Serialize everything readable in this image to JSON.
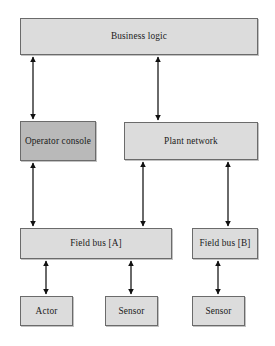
{
  "diagram": {
    "background_color": "#ffffff",
    "box_fill_light": "#dcdcdc",
    "box_fill_dark": "#b9b9b9",
    "box_border_color": "#6b6b6b",
    "arrow_color": "#101010",
    "nodes": [
      {
        "id": "business-logic",
        "label": "Business logic",
        "shade": "light",
        "x": 20,
        "y": 18,
        "w": 238,
        "h": 37
      },
      {
        "id": "operator-console",
        "label": "Operator console",
        "shade": "dark",
        "x": 20,
        "y": 121,
        "w": 76,
        "h": 40
      },
      {
        "id": "plant-network",
        "label": "Plant network",
        "shade": "light",
        "x": 124,
        "y": 122,
        "w": 134,
        "h": 38
      },
      {
        "id": "field-bus-a",
        "label": "Field bus [A]",
        "shade": "light",
        "x": 20,
        "y": 228,
        "w": 152,
        "h": 31
      },
      {
        "id": "field-bus-b",
        "label": "Field bus [B]",
        "shade": "light",
        "x": 192,
        "y": 228,
        "w": 66,
        "h": 31
      },
      {
        "id": "actor",
        "label": "Actor",
        "shade": "light",
        "x": 20,
        "y": 296,
        "w": 53,
        "h": 30
      },
      {
        "id": "sensor-a",
        "label": "Sensor",
        "shade": "light",
        "x": 105,
        "y": 296,
        "w": 53,
        "h": 30
      },
      {
        "id": "sensor-b",
        "label": "Sensor",
        "shade": "light",
        "x": 192,
        "y": 296,
        "w": 53,
        "h": 30
      }
    ],
    "connections": [
      {
        "id": "business-logic-to-operator-console",
        "from": "business-logic",
        "to": "operator-console",
        "x": 33,
        "y1": 55,
        "y2": 121,
        "bidirectional": true
      },
      {
        "id": "business-logic-to-plant-network",
        "from": "business-logic",
        "to": "plant-network",
        "x": 158,
        "y1": 55,
        "y2": 122,
        "bidirectional": true
      },
      {
        "id": "operator-console-to-field-bus-a",
        "from": "operator-console",
        "to": "field-bus-a",
        "x": 33,
        "y1": 161,
        "y2": 228,
        "bidirectional": true
      },
      {
        "id": "plant-network-to-field-bus-a",
        "from": "plant-network",
        "to": "field-bus-a",
        "x": 143,
        "y1": 160,
        "y2": 228,
        "bidirectional": true
      },
      {
        "id": "plant-network-to-field-bus-b",
        "from": "plant-network",
        "to": "field-bus-b",
        "x": 228,
        "y1": 160,
        "y2": 228,
        "bidirectional": true
      },
      {
        "id": "field-bus-a-to-actor",
        "from": "field-bus-a",
        "to": "actor",
        "x": 46,
        "y1": 259,
        "y2": 296,
        "bidirectional": true
      },
      {
        "id": "field-bus-a-to-sensor-a",
        "from": "field-bus-a",
        "to": "sensor-a",
        "x": 131,
        "y1": 259,
        "y2": 296,
        "bidirectional": true
      },
      {
        "id": "field-bus-b-to-sensor-b",
        "from": "field-bus-b",
        "to": "sensor-b",
        "x": 218,
        "y1": 259,
        "y2": 296,
        "bidirectional": true
      }
    ]
  }
}
